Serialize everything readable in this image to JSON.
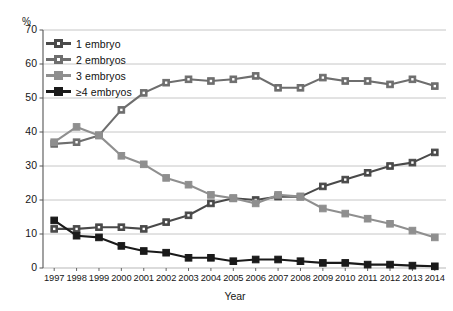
{
  "chart_data": {
    "type": "line",
    "title": "",
    "subtitle": "",
    "xlabel": "Year",
    "ylabel": "%",
    "ylim": [
      0,
      70
    ],
    "ytick_step": 10,
    "grid": true,
    "legend_position": "top-left",
    "categories": [
      "1997",
      "1998",
      "1999",
      "2000",
      "2001",
      "2002",
      "2003",
      "2004",
      "2005",
      "2006",
      "2007",
      "2008",
      "2009",
      "2010",
      "2011",
      "2012",
      "2013",
      "2014"
    ],
    "yticks": [
      "0",
      "10",
      "20",
      "30",
      "40",
      "50",
      "60",
      "70"
    ],
    "series": [
      {
        "name": "1 embryo",
        "color": "#4a4a4a",
        "marker": "square-open",
        "values": [
          11.5,
          11.5,
          12.0,
          12.0,
          11.5,
          13.5,
          15.5,
          19.0,
          20.5,
          20.0,
          21.0,
          21.0,
          24.0,
          26.0,
          28.0,
          30.0,
          31.0,
          34.0
        ]
      },
      {
        "name": "2 embryos",
        "color": "#6e6e6e",
        "marker": "square-open",
        "values": [
          36.5,
          37.0,
          39.0,
          46.5,
          51.5,
          54.5,
          55.5,
          55.0,
          55.5,
          56.5,
          53.0,
          53.0,
          56.0,
          55.0,
          55.0,
          54.0,
          55.5,
          53.5
        ]
      },
      {
        "name": "3 embryos",
        "color": "#8f8f8f",
        "marker": "square-solid",
        "values": [
          37.0,
          41.5,
          39.0,
          33.0,
          30.5,
          26.5,
          24.5,
          21.5,
          20.5,
          19.0,
          21.5,
          21.0,
          17.5,
          16.0,
          14.5,
          13.0,
          11.0,
          9.0
        ]
      },
      {
        "name": "≥4 embryos",
        "color": "#1a1a1a",
        "marker": "square-solid",
        "values": [
          14.0,
          9.5,
          9.0,
          6.5,
          5.0,
          4.5,
          3.0,
          3.0,
          2.0,
          2.5,
          2.5,
          2.0,
          1.5,
          1.5,
          1.0,
          1.0,
          0.7,
          0.5
        ]
      }
    ]
  },
  "legend": {
    "items": [
      {
        "label": "1 embryo"
      },
      {
        "label": "2 embryos"
      },
      {
        "label": "3 embryos"
      },
      {
        "label": "≥4 embryos"
      }
    ]
  },
  "axes": {
    "y_unit": "%",
    "x_title": "Year"
  },
  "colors": {
    "series_1_embryo": "#4a4a4a",
    "series_2_embryos": "#6e6e6e",
    "series_3_embryos": "#8f8f8f",
    "series_4plus_embryos": "#1a1a1a",
    "grid": "#b7b7b7",
    "axis": "#555555",
    "background": "#ffffff",
    "text": "#161616"
  }
}
